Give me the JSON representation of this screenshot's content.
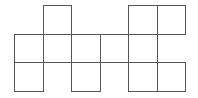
{
  "diagram": {
    "type": "cube-net-grid",
    "line_color": "#555555",
    "background": "#ffffff",
    "cell_size": 28.5,
    "origin": {
      "x": 14,
      "y": 5
    },
    "columns": 6,
    "rows": 3,
    "cells": [
      {
        "row": 0,
        "col": 1
      },
      {
        "row": 0,
        "col": 4
      },
      {
        "row": 0,
        "col": 5
      },
      {
        "row": 1,
        "col": 0
      },
      {
        "row": 1,
        "col": 1
      },
      {
        "row": 1,
        "col": 2
      },
      {
        "row": 1,
        "col": 3
      },
      {
        "row": 1,
        "col": 4
      },
      {
        "row": 2,
        "col": 0
      },
      {
        "row": 2,
        "col": 2
      },
      {
        "row": 2,
        "col": 4
      },
      {
        "row": 2,
        "col": 5
      }
    ]
  }
}
